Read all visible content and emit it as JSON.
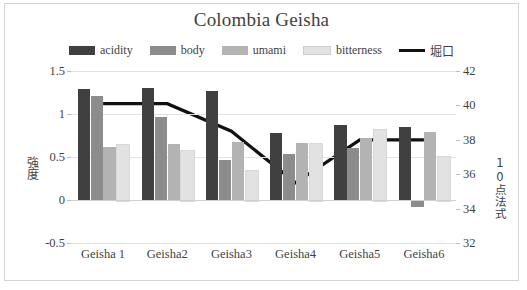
{
  "chart_data": {
    "type": "bar",
    "title": "Colombia Geisha",
    "categories": [
      "Geisha 1",
      "Geisha2",
      "Geisha3",
      "Geisha4",
      "Geisha5",
      "Geisha6"
    ],
    "series": [
      {
        "name": "acidity",
        "type": "bar",
        "axis": "left",
        "color": "#404040",
        "values": [
          1.29,
          1.3,
          1.27,
          0.78,
          0.87,
          0.85
        ]
      },
      {
        "name": "body",
        "type": "bar",
        "axis": "left",
        "color": "#8c8c8c",
        "values": [
          1.21,
          0.96,
          0.47,
          0.53,
          0.6,
          -0.08
        ]
      },
      {
        "name": "umami",
        "type": "bar",
        "axis": "left",
        "color": "#b3b3b3",
        "values": [
          0.62,
          0.65,
          0.68,
          0.66,
          0.72,
          0.79
        ]
      },
      {
        "name": "bitterness",
        "type": "bar",
        "axis": "left",
        "color": "#e2e2e2",
        "values": [
          0.65,
          0.58,
          0.35,
          0.66,
          0.83,
          0.51
        ]
      },
      {
        "name": "堀口",
        "type": "line",
        "axis": "right",
        "color": "#111111",
        "values": [
          40.1,
          40.1,
          38.5,
          35.5,
          38.0,
          38.0
        ]
      }
    ],
    "xlabel": "",
    "ylabel": "強度",
    "ylabel_secondary": "10点法式",
    "ylim": [
      -0.5,
      1.5
    ],
    "yticks": [
      "1.5",
      "1",
      "0.5",
      "0",
      "-0.5"
    ],
    "ylim_secondary": [
      32,
      42
    ],
    "yticks_secondary": [
      "42",
      "40",
      "38",
      "36",
      "34",
      "32"
    ],
    "grid": true,
    "legend_position": "top"
  }
}
